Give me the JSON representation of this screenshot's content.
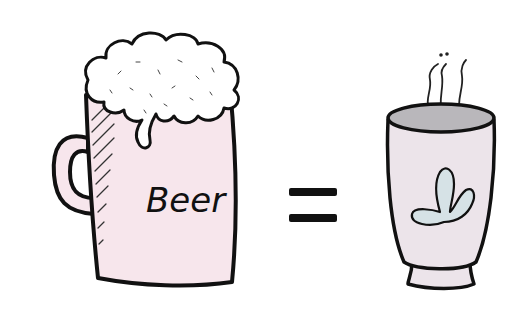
{
  "illustration": {
    "beer_mug": {
      "label": "Beer",
      "body_color": "#f7e6ec",
      "foam_color": "#ffffff",
      "outline_color": "#111111"
    },
    "equals_sign": {
      "glyph": "=",
      "color": "#111111"
    },
    "tea_cup": {
      "body_color": "#ece4ea",
      "tea_surface_color": "#b9b7bb",
      "leaf_motif_color": "#d6e2e6",
      "outline_color": "#111111"
    }
  }
}
